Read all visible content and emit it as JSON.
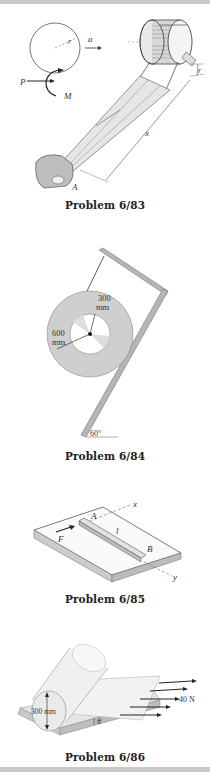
{
  "problems": [
    {
      "caption": "Problem 6/83",
      "labels": {
        "radius": "r",
        "accel": "a",
        "force": "P",
        "moment": "M",
        "distance": "x",
        "point": "A",
        "drum_radius": "r"
      }
    },
    {
      "caption": "Problem 6/84",
      "labels": {
        "inner": "300",
        "inner_unit": "mm",
        "outer": "600",
        "outer_unit": "mm",
        "angle": "60°"
      }
    },
    {
      "caption": "Problem 6/85",
      "labels": {
        "axis_x": "x",
        "axis_y": "y",
        "point_a": "A",
        "point_b": "B",
        "length": "l",
        "force": "F"
      }
    },
    {
      "caption": "Problem 6/86",
      "labels": {
        "diameter": "300 mm",
        "force": "40 N",
        "angle": "θ"
      }
    }
  ]
}
